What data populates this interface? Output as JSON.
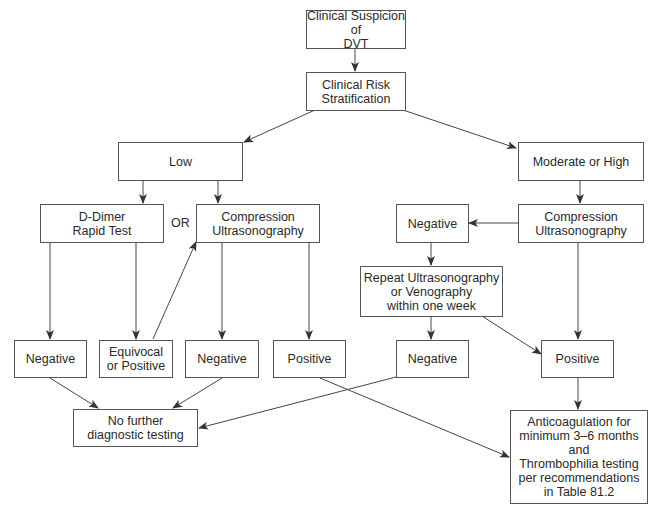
{
  "diagram": {
    "type": "flowchart",
    "topic": "DVT diagnostic algorithm",
    "nodes": {
      "suspicion": "Clinical Suspicion of\nDVT",
      "risk": "Clinical Risk\nStratification",
      "low": "Low",
      "mod_high": "Moderate or High",
      "ddimer": "D-Dimer\nRapid Test",
      "or_label": "OR",
      "cus_left": "Compression\nUltrasonography",
      "neg_right_top": "Negative",
      "cus_right": "Compression\nUltrasonography",
      "repeat": "Repeat Ultrasonography\nor Venography\nwithin one week",
      "neg_ddimer": "Negative",
      "equivocal": "Equivocal\nor Positive",
      "neg_cus_left": "Negative",
      "pos_cus_left": "Positive",
      "neg_repeat": "Negative",
      "pos_right": "Positive",
      "no_further": "No further\ndiagnostic testing",
      "anticoag": "Anticoagulation for\nminimum 3–6 months\nand\nThrombophilia testing\nper recommendations\nin Table 81.2"
    },
    "edges": [
      [
        "suspicion",
        "risk"
      ],
      [
        "risk",
        "low"
      ],
      [
        "risk",
        "mod_high"
      ],
      [
        "low",
        "ddimer"
      ],
      [
        "low",
        "cus_left"
      ],
      [
        "mod_high",
        "cus_right"
      ],
      [
        "cus_right",
        "neg_right_top"
      ],
      [
        "neg_right_top",
        "repeat"
      ],
      [
        "ddimer",
        "neg_ddimer"
      ],
      [
        "ddimer",
        "equivocal"
      ],
      [
        "equivocal",
        "cus_left"
      ],
      [
        "cus_left",
        "neg_cus_left"
      ],
      [
        "cus_left",
        "pos_cus_left"
      ],
      [
        "repeat",
        "neg_repeat"
      ],
      [
        "repeat",
        "pos_right"
      ],
      [
        "cus_right",
        "pos_right"
      ],
      [
        "neg_ddimer",
        "no_further"
      ],
      [
        "neg_cus_left",
        "no_further"
      ],
      [
        "neg_repeat",
        "no_further"
      ],
      [
        "pos_cus_left",
        "anticoag"
      ],
      [
        "pos_right",
        "anticoag"
      ]
    ]
  }
}
